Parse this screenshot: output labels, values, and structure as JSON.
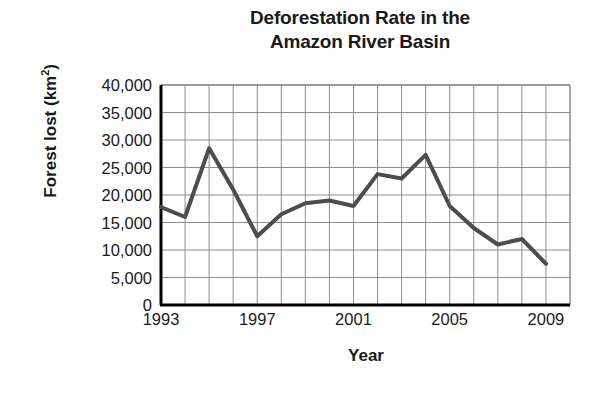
{
  "chart_data": {
    "type": "line",
    "title": "Deforestation Rate in the Amazon River Basin",
    "title_lines": [
      "Deforestation Rate in the",
      "Amazon River Basin"
    ],
    "xlabel": "Year",
    "ylabel": "Forest lost (km²)",
    "ylabel_text": "Forest lost (km",
    "ylabel_sup": "2",
    "ylabel_tail": ")",
    "x": [
      1993,
      1994,
      1995,
      1996,
      1997,
      1998,
      1999,
      2000,
      2001,
      2002,
      2003,
      2004,
      2005,
      2006,
      2007,
      2008,
      2009
    ],
    "values": [
      17800,
      16000,
      28500,
      21000,
      12500,
      16500,
      18500,
      19000,
      18000,
      23800,
      23000,
      27300,
      18000,
      14000,
      11000,
      12000,
      7500
    ],
    "xlim": [
      1993,
      2010
    ],
    "ylim": [
      0,
      40000
    ],
    "ytick_values": [
      0,
      5000,
      10000,
      15000,
      20000,
      25000,
      30000,
      35000,
      40000
    ],
    "ytick_labels": [
      "0",
      "5,000",
      "10,000",
      "15,000",
      "20,000",
      "25,000",
      "30,000",
      "35,000",
      "40,000"
    ],
    "xtick_values": [
      1993,
      1997,
      2001,
      2005,
      2009
    ],
    "xtick_labels": [
      "1993",
      "1997",
      "2001",
      "2005",
      "2009"
    ],
    "gridline_years": [
      1994,
      1995,
      1996,
      1997,
      1998,
      1999,
      2000,
      2001,
      2002,
      2003,
      2004,
      2005,
      2006,
      2007,
      2008,
      2009
    ],
    "grid": true,
    "legend": "none",
    "line_color": "#4d4d4d",
    "grid_color": "#8c8c8c",
    "axis_color": "#000000",
    "background_color": "#ffffff",
    "line_width": 4
  }
}
